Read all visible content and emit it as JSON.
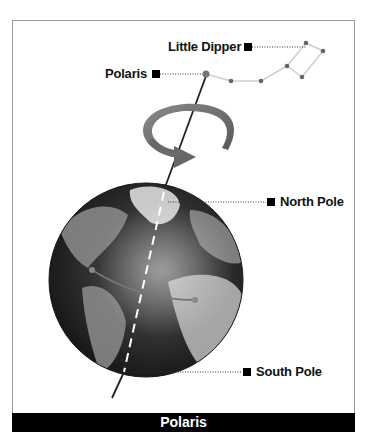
{
  "labels": {
    "little_dipper": "Little Dipper",
    "polaris": "Polaris",
    "north_pole": "North Pole",
    "south_pole": "South Pole"
  },
  "caption": "Polaris",
  "colors": {
    "frame_border": "#9a9a9a",
    "caption_bg": "#000000",
    "caption_text": "#ffffff",
    "star": "#666666",
    "constellation_line": "#cccccc",
    "rotation_arrow": "#6e6e6e",
    "globe_ocean": "#2e2e2e",
    "globe_land": "#9a9a9a"
  },
  "icons": {
    "marker": "square-marker-icon",
    "rotation": "rotation-arrow-icon",
    "globe": "earth-globe-icon",
    "star": "star-dot-icon"
  }
}
